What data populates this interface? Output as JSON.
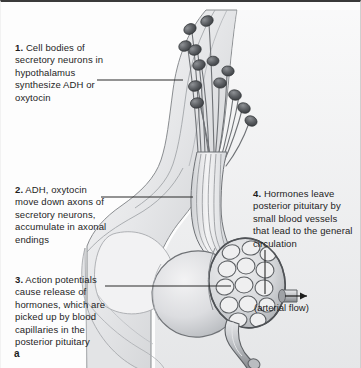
{
  "figure": {
    "panel_label": "a",
    "kind": "anatomical-illustration",
    "palette": {
      "ink": "#1d1d1d",
      "top_rule": "#3a3a3a",
      "tissue_light": "#ededee",
      "tissue_mid": "#d7d8da",
      "tissue_dark": "#a9abae",
      "outline": "#5d6064",
      "soma_fill": "#5a5d61",
      "background": "#fdfdfd"
    }
  },
  "callouts": [
    {
      "id": "callout-1",
      "number": "1.",
      "text": "Cell bodies of secretory neurons in hypothalamus synthesize ADH or oxytocin",
      "leader": {
        "type": "horizontal",
        "x1": 96,
        "y1": 78,
        "x2": 182,
        "y2": 78
      }
    },
    {
      "id": "callout-2",
      "number": "2.",
      "text": "ADH, oxytocin move down axons of secretory neurons, accumulate in axonal endings",
      "leader": {
        "type": "horizontal",
        "x1": 100,
        "y1": 195,
        "x2": 192,
        "y2": 195
      }
    },
    {
      "id": "callout-3",
      "number": "3.",
      "text": "Action potentials cause release of hormones, which are picked up by blood capillaries in the posterior pituitary",
      "leader": {
        "type": "horizontal",
        "x1": 104,
        "y1": 284,
        "x2": 230,
        "y2": 284
      }
    },
    {
      "id": "callout-4",
      "number": "4.",
      "text": "Hormones leave posterior pituitary by small blood vessels that lead to the general circulation",
      "leader": {
        "type": "vertical",
        "x1": 264,
        "y1": 248,
        "x2": 264,
        "y2": 292
      }
    }
  ],
  "annotations": [
    {
      "id": "arterial-flow",
      "text": "(arterial flow)",
      "arrow": "right"
    }
  ],
  "structures": [
    {
      "name": "hypothalamus",
      "label_shown": false
    },
    {
      "name": "secretory-neuron-cell-bodies",
      "count": 13,
      "label_shown": false
    },
    {
      "name": "infundibulum-stalk",
      "label_shown": false
    },
    {
      "name": "anterior-pituitary",
      "label_shown": false
    },
    {
      "name": "posterior-pituitary",
      "label_shown": false
    },
    {
      "name": "capillary-network",
      "label_shown": false
    },
    {
      "name": "arterial-vessel",
      "label_shown": false
    },
    {
      "name": "venous-vessel",
      "label_shown": false
    }
  ]
}
